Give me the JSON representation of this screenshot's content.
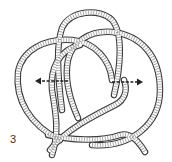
{
  "figure": {
    "step_number": "3",
    "arrows": [
      {
        "name": "left-arrow",
        "direction": "left"
      },
      {
        "name": "right-arrow",
        "direction": "right"
      }
    ],
    "colors": {
      "rope_outline": "#3a3a3a",
      "rope_hatch": "#9a9a9a",
      "arrow": "#222222",
      "background": "#ffffff"
    }
  }
}
